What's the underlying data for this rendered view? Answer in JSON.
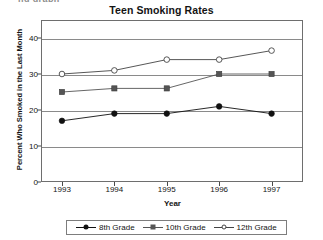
{
  "top_clip": {
    "text": "ng graph"
  },
  "chart_data": {
    "type": "line",
    "title": "Teen Smoking Rates",
    "xlabel": "Year",
    "ylabel": "Percent Who Smoked in the Last Month",
    "categories": [
      "1993",
      "1994",
      "1995",
      "1996",
      "1997"
    ],
    "x": [
      1993,
      1994,
      1995,
      1996,
      1997
    ],
    "xlim": [
      1992.6,
      1997.6
    ],
    "ylim": [
      0,
      45
    ],
    "yticks": [
      0,
      10,
      20,
      30,
      40
    ],
    "ytick_labels": [
      "0",
      "10",
      "20",
      "30",
      "40"
    ],
    "grid": true,
    "legend_position": "bottom",
    "series": [
      {
        "name": "8th Grade",
        "marker": "circle-filled",
        "color": "#111111",
        "values": [
          17,
          19,
          19,
          21,
          19
        ]
      },
      {
        "name": "10th Grade",
        "marker": "square-filled",
        "color": "#555555",
        "values": [
          25,
          26,
          26,
          30,
          30
        ]
      },
      {
        "name": "12th Grade",
        "marker": "circle-open",
        "color": "#444444",
        "values": [
          30,
          31,
          34,
          34,
          36.5
        ]
      }
    ]
  }
}
